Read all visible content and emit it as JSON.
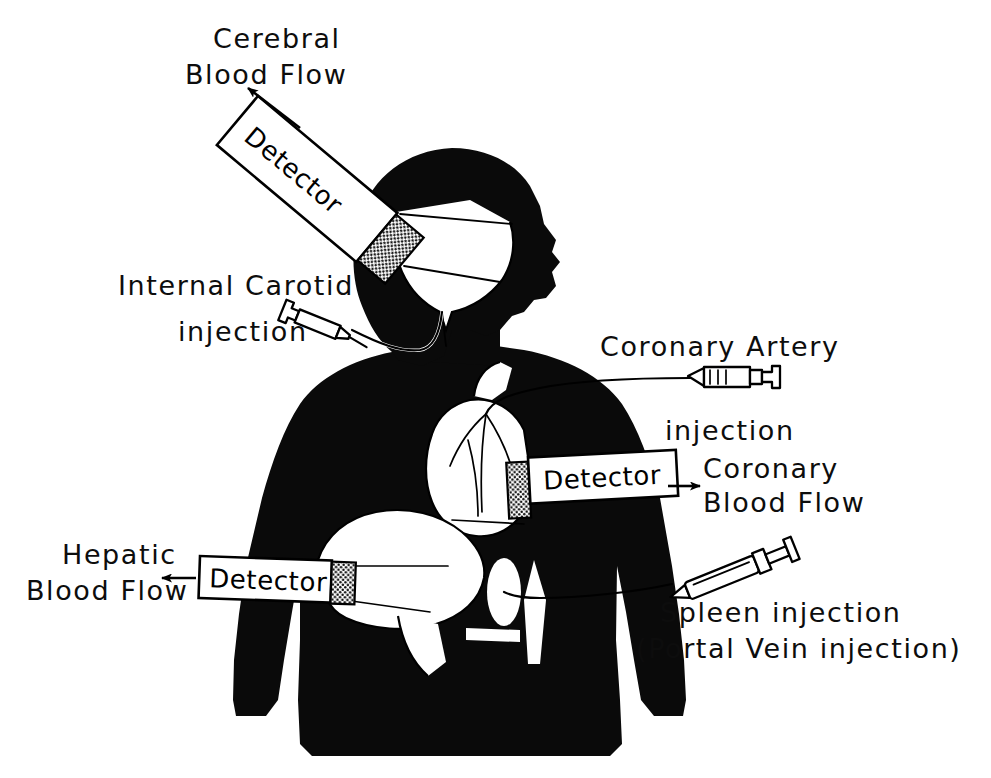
{
  "figure": {
    "background_color": "#ffffff",
    "ink_color": "#0a0a0a",
    "organ_color": "#ffffff"
  },
  "labels": {
    "cerebral_blood_flow_line1": "Cerebral",
    "cerebral_blood_flow_line2": "Blood Flow",
    "internal_carotid_line1": "Internal Carotid",
    "internal_carotid_line2": "injection",
    "coronary_artery_line1": "Coronary Artery",
    "coronary_artery_line2": "injection",
    "coronary_blood_flow_line1": "Coronary",
    "coronary_blood_flow_line2": "Blood Flow",
    "hepatic_blood_flow_line1": "Hepatic",
    "hepatic_blood_flow_line2": "Blood Flow",
    "spleen_injection_line1": "Spleen injection",
    "spleen_injection_line2": "(Portal Vein injection)"
  },
  "detectors": [
    {
      "id": "cerebral",
      "label": "Detector",
      "target": "brain",
      "orientation": "diagonal"
    },
    {
      "id": "coronary",
      "label": "Detector",
      "target": "heart",
      "orientation": "horizontal"
    },
    {
      "id": "hepatic",
      "label": "Detector",
      "target": "liver",
      "orientation": "horizontal"
    }
  ],
  "injection_sites": [
    {
      "id": "internal-carotid",
      "label": "Internal Carotid injection",
      "icon": "syringe-icon"
    },
    {
      "id": "coronary-artery",
      "label": "Coronary Artery injection",
      "icon": "syringe-icon"
    },
    {
      "id": "spleen-portal",
      "label": "Spleen injection (Portal Vein injection)",
      "icon": "syringe-icon"
    }
  ],
  "anatomy": [
    {
      "id": "head",
      "name": "head-profile"
    },
    {
      "id": "brain",
      "name": "brain-cutaway"
    },
    {
      "id": "torso",
      "name": "torso-silhouette"
    },
    {
      "id": "heart",
      "name": "heart-organ"
    },
    {
      "id": "liver",
      "name": "liver-organ"
    },
    {
      "id": "spleen",
      "name": "spleen-organ"
    }
  ]
}
